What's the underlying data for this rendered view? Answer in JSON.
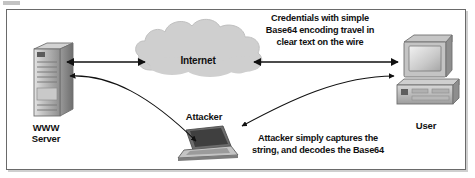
{
  "figure": {
    "type": "network-security-diagram",
    "border_color": "#6a6a6a",
    "background": "#ffffff",
    "ink_color": "#111111",
    "cloud_fill": "#cfcfcf",
    "device_fill": "#b5b5b5"
  },
  "nodes": {
    "server": {
      "label": "WWW\nServer",
      "icon": "server-tower-icon"
    },
    "cloud": {
      "label": "Internet",
      "icon": "cloud-icon"
    },
    "user": {
      "label": "User",
      "icon": "desktop-computer-icon"
    },
    "attacker": {
      "label": "Attacker",
      "icon": "laptop-icon"
    }
  },
  "annotations": {
    "top": "Credentials with simple\nBase64 encoding travel in\nclear text on the wire",
    "bottom": "Attacker simply captures the\nstring, and decodes the Base64"
  },
  "connections": [
    {
      "name": "server-cloud-link",
      "from": "server",
      "to": "cloud",
      "style": "double-arrow"
    },
    {
      "name": "cloud-user-link",
      "from": "cloud",
      "to": "user",
      "style": "double-arrow"
    },
    {
      "name": "server-attacker-curve",
      "from": "server",
      "to": "attacker",
      "style": "curved-double-arrow"
    },
    {
      "name": "user-attacker-curve",
      "from": "user",
      "to": "attacker",
      "style": "curved-double-arrow"
    }
  ]
}
